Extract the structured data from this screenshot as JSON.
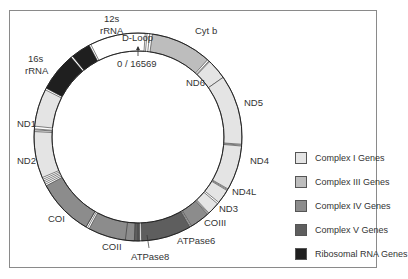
{
  "diagram": {
    "origin_label": "0 / 16569",
    "colors": {
      "complex_i": "#e4e4e4",
      "complex_iii": "#bdbdbd",
      "complex_iv": "#8c8c8c",
      "complex_v": "#5e5e5e",
      "ribosomal_rna": "#1f1f1f",
      "non_coding": "#ffffff",
      "outline": "#333333"
    },
    "segments": [
      {
        "name": "D-Loop",
        "type": "non_coding",
        "start": -27,
        "end": 4
      },
      {
        "name": "Cyt b",
        "type": "complex_iii",
        "start": 8,
        "end": 44
      },
      {
        "name": "ND6",
        "type": "complex_i",
        "start": 45,
        "end": 60
      },
      {
        "name": "ND5",
        "type": "complex_i",
        "start": 60,
        "end": 108
      },
      {
        "name": "ND4",
        "type": "complex_i",
        "start": 110,
        "end": 139
      },
      {
        "name": "ND4L",
        "type": "complex_i",
        "start": 140,
        "end": 149
      },
      {
        "name": "ND3",
        "type": "complex_i",
        "start": 151,
        "end": 159
      },
      {
        "name": "COIII",
        "type": "complex_iv",
        "start": 160,
        "end": 171
      },
      {
        "name": "ATPase6",
        "type": "complex_v",
        "start": 171,
        "end": 193
      },
      {
        "name": "ATPase8",
        "type": "complex_v",
        "start": 194,
        "end": 199
      },
      {
        "name": "COII",
        "type": "complex_iv",
        "start": 201,
        "end": 222
      },
      {
        "name": "COI",
        "type": "complex_iv",
        "start": 225,
        "end": 262
      },
      {
        "name": "ND2",
        "type": "complex_i",
        "start": 268,
        "end": 292
      },
      {
        "name": "ND1",
        "type": "complex_i",
        "start": 294,
        "end": 313
      },
      {
        "name": "16s rRNA",
        "type": "ribosomal_rna",
        "start": 315,
        "end": 342
      },
      {
        "name": "12s rRNA",
        "type": "ribosomal_rna",
        "start": 343,
        "end": 331
      }
    ],
    "labels": [
      {
        "text": "12s",
        "x": 104,
        "y": 18
      },
      {
        "text": "rRNA",
        "x": 100,
        "y": 30
      },
      {
        "text": "16s",
        "x": 28,
        "y": 58
      },
      {
        "text": "rRNA",
        "x": 25,
        "y": 70
      },
      {
        "text": "D-Loop",
        "x": 122,
        "y": 36
      },
      {
        "text": "0 / 16569",
        "x": 117,
        "y": 60
      },
      {
        "text": "Cyt b",
        "x": 195,
        "y": 29
      },
      {
        "text": "ND6",
        "x": 186,
        "y": 81
      },
      {
        "text": "ND5",
        "x": 244,
        "y": 101
      },
      {
        "text": "ND1",
        "x": 17,
        "y": 121
      },
      {
        "text": "ND2",
        "x": 17,
        "y": 158
      },
      {
        "text": "ND4",
        "x": 250,
        "y": 158
      },
      {
        "text": "ND4L",
        "x": 232,
        "y": 189
      },
      {
        "text": "ND3",
        "x": 219,
        "y": 205
      },
      {
        "text": "COIII",
        "x": 204,
        "y": 220
      },
      {
        "text": "COI",
        "x": 48,
        "y": 215
      },
      {
        "text": "COII",
        "x": 102,
        "y": 242
      },
      {
        "text": "ATPase6",
        "x": 177,
        "y": 237
      },
      {
        "text": "ATPase8",
        "x": 131,
        "y": 253
      }
    ]
  },
  "legend": {
    "items": [
      {
        "label": "Complex I Genes",
        "color": "#e4e4e4"
      },
      {
        "label": "Complex III Genes",
        "color": "#bdbdbd"
      },
      {
        "label": "Complex IV Genes",
        "color": "#8c8c8c"
      },
      {
        "label": "Complex V Genes",
        "color": "#5e5e5e"
      },
      {
        "label": "Ribosomal RNA Genes",
        "color": "#1f1f1f"
      }
    ]
  }
}
